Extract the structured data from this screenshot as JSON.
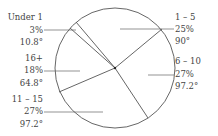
{
  "chart_data": {
    "type": "pie",
    "title": "",
    "center": [
      115,
      68
    ],
    "radius": 60,
    "slices": [
      {
        "label": "1 – 5",
        "percent": "25%",
        "degrees": "90°",
        "value": 25,
        "angle": 90
      },
      {
        "label": "6 – 10",
        "percent": "27%",
        "degrees": "97.2°",
        "value": 27,
        "angle": 97.2
      },
      {
        "label": "11 – 15",
        "percent": "27%",
        "degrees": "97.2°",
        "value": 27,
        "angle": 97.2
      },
      {
        "label": "16+",
        "percent": "18%",
        "degrees": "64.8°",
        "value": 18,
        "angle": 64.8
      },
      {
        "label": "Under 1",
        "percent": "3%",
        "degrees": "10.8°",
        "value": 3,
        "angle": 10.8
      }
    ],
    "boundaries": [
      {
        "name": "under1-1to5",
        "end": [
          76,
          22
        ]
      },
      {
        "name": "1to5-6to10",
        "end": [
          162,
          29
        ]
      },
      {
        "name": "6to10-11to15",
        "end": [
          148,
          118
        ]
      },
      {
        "name": "11to15-16plus",
        "end": [
          59,
          92
        ]
      },
      {
        "name": "16plus-under1",
        "end": [
          70,
          28
        ]
      }
    ],
    "labels": [
      {
        "slice": 4,
        "x": 43,
        "lines_y": [
          20,
          33,
          45
        ],
        "anchor": "end",
        "leader": [
          [
            44,
            30
          ],
          [
            76,
            30
          ]
        ]
      },
      {
        "slice": 0,
        "x": 175,
        "lines_y": [
          20,
          32,
          44
        ],
        "anchor": "start",
        "leader": [
          [
            120,
            29
          ],
          [
            174,
            29
          ]
        ]
      },
      {
        "slice": 1,
        "x": 175,
        "lines_y": [
          64,
          77,
          89
        ],
        "anchor": "start",
        "leader": [
          [
            148,
            75
          ],
          [
            174,
            75
          ]
        ]
      },
      {
        "slice": 3,
        "x": 43,
        "lines_y": [
          61,
          73,
          86
        ],
        "anchor": "end",
        "leader": [
          [
            44,
            71
          ],
          [
            80,
            71
          ]
        ]
      },
      {
        "slice": 2,
        "x": 43,
        "lines_y": [
          102,
          114,
          127
        ],
        "anchor": "end",
        "leader": [
          [
            44,
            112
          ],
          [
            103,
            112
          ]
        ]
      }
    ]
  }
}
